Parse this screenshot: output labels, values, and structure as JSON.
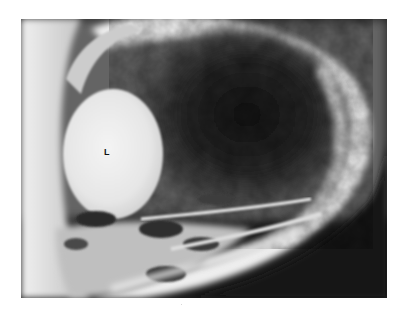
{
  "figure": {
    "type": "radiograph",
    "modality": "X-ray",
    "colors": {
      "background": "#ffffff",
      "dark_soft_tissue": "#1a1a1a",
      "mid_gray": "#6e6e6e",
      "bone_white": "#f2f2f2"
    },
    "annotations": [
      {
        "text": "L",
        "x": 104,
        "y": 150
      }
    ]
  }
}
